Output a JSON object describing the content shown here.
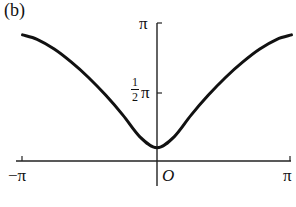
{
  "panel_label": "(b)",
  "chart_data": {
    "type": "line",
    "title": "(b)",
    "xlabel": "",
    "ylabel": "",
    "xlim": [
      -3.1416,
      3.1416
    ],
    "ylim": [
      0,
      3.1416
    ],
    "grid": false,
    "legend": null,
    "x_ticks": [
      "-π",
      "O",
      "π"
    ],
    "y_ticks": [
      "½π",
      "π"
    ],
    "origin_label": "O",
    "series": [
      {
        "name": "curve",
        "x": [
          -3.1416,
          -2.8,
          -2.4,
          -2.0,
          -1.6,
          -1.2,
          -0.8,
          -0.4,
          0,
          0.4,
          0.8,
          1.2,
          1.6,
          2.0,
          2.4,
          2.8,
          3.1416
        ],
        "y": [
          2.87,
          2.77,
          2.55,
          2.25,
          1.9,
          1.5,
          1.05,
          0.55,
          0.3,
          0.55,
          1.05,
          1.5,
          1.9,
          2.25,
          2.55,
          2.77,
          2.87
        ]
      }
    ]
  },
  "labels": {
    "x_neg_pi": "−π",
    "x_pi": "π",
    "origin": "O",
    "y_pi": "π",
    "y_half_num": "1",
    "y_half_den": "2",
    "y_half_pi": "π"
  }
}
